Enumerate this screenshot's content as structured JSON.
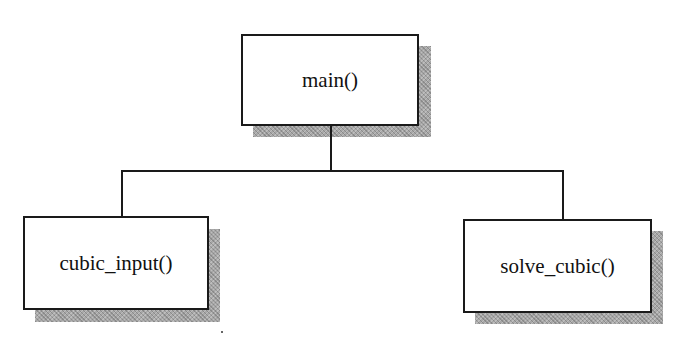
{
  "diagram": {
    "type": "call-hierarchy",
    "root": {
      "label": "main()"
    },
    "children": [
      {
        "label": "cubic_input()"
      },
      {
        "label": "solve_cubic()"
      }
    ],
    "edges": [
      {
        "from": "main()",
        "to": "cubic_input()"
      },
      {
        "from": "main()",
        "to": "solve_cubic()"
      }
    ]
  },
  "colors": {
    "border": "#1a1a1a",
    "shadow": "#a8a8a8",
    "background": "#ffffff"
  }
}
